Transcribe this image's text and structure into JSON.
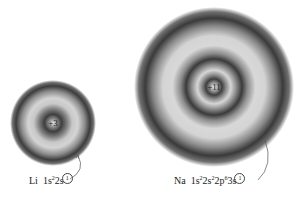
{
  "atoms": [
    {
      "symbol": "Li",
      "nucleus_charge": "+3",
      "config_prefix": "1s",
      "config_parts": [
        {
          "orbital": "1s",
          "electrons": "2"
        },
        {
          "orbital": "2s",
          "electrons": "1"
        }
      ],
      "label_symbol": "Li",
      "label_main": "1s",
      "label_sup1": "2",
      "label_mid": "2s",
      "label_circled": "1"
    },
    {
      "symbol": "Na",
      "nucleus_charge": "+11",
      "config_parts": [
        {
          "orbital": "1s",
          "electrons": "2"
        },
        {
          "orbital": "2s",
          "electrons": "2"
        },
        {
          "orbital": "2p",
          "electrons": "6"
        },
        {
          "orbital": "3s",
          "electrons": "1"
        }
      ],
      "label_symbol": "Na",
      "l1": "1s",
      "s1": "2",
      "l2": "2s",
      "s2": "2",
      "l3": "2p",
      "s3": "6",
      "l4": "3s",
      "label_circled": "1"
    }
  ],
  "colors": {
    "ring_dark": "#3a3a3a",
    "ring_light": "#d8d8d8",
    "background": "#ffffff"
  }
}
